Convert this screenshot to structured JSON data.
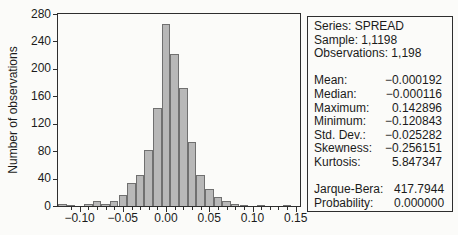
{
  "figure": {
    "background": "#fbfbf9",
    "frame_color": "#2e2e2e",
    "bar_fill": "#b8b8b8",
    "bar_border": "#707070",
    "text_color": "#1b1b1b"
  },
  "chart_data": {
    "type": "bar",
    "title": "",
    "xlabel": "",
    "ylabel": "Number of observations",
    "grid": false,
    "legend": false,
    "xlim": [
      -0.125,
      0.155
    ],
    "ylim": [
      0,
      280
    ],
    "y_ticks": [
      0,
      40,
      80,
      120,
      160,
      200,
      240,
      280
    ],
    "x_minor_tick_step": 0.01,
    "x_tick_labels": [
      {
        "value": -0.1,
        "label": "−0.10"
      },
      {
        "value": -0.05,
        "label": "−0.05"
      },
      {
        "value": 0.0,
        "label": "0.00"
      },
      {
        "value": 0.05,
        "label": "0.05"
      },
      {
        "value": 0.1,
        "label": "0.10"
      },
      {
        "value": 0.15,
        "label": "0.15"
      }
    ],
    "bin_width": 0.01,
    "bin_centers": [
      -0.12,
      -0.11,
      -0.1,
      -0.09,
      -0.08,
      -0.07,
      -0.06,
      -0.05,
      -0.04,
      -0.03,
      -0.02,
      -0.01,
      0.0,
      0.01,
      0.02,
      0.03,
      0.04,
      0.05,
      0.06,
      0.07,
      0.08,
      0.09,
      0.1,
      0.11,
      0.12,
      0.13,
      0.14
    ],
    "counts": [
      3,
      2,
      0,
      3,
      8,
      3,
      8,
      16,
      34,
      45,
      82,
      143,
      265,
      222,
      172,
      93,
      45,
      25,
      13,
      8,
      3,
      2,
      0,
      1,
      0,
      0,
      2
    ]
  },
  "stats_box": {
    "header_lines": [
      "Series: SPREAD",
      "Sample: 1,1198",
      "Observations: 1,198"
    ],
    "rows_main": [
      {
        "label": "Mean:",
        "value": "−0.000192"
      },
      {
        "label": "Median:",
        "value": "−0.000116"
      },
      {
        "label": "Maximum:",
        "value": "0.142896"
      },
      {
        "label": "Minimum:",
        "value": "−0.120843"
      },
      {
        "label": "Std. Dev.:",
        "value": "−0.025282"
      },
      {
        "label": "Skewness:",
        "value": "−0.256151"
      },
      {
        "label": "Kurtosis:",
        "value": "5.847347"
      }
    ],
    "rows_tests": [
      {
        "label": "Jarque-Bera:",
        "value": "417.7944"
      },
      {
        "label": "Probability:",
        "value": "0.000000"
      }
    ]
  }
}
